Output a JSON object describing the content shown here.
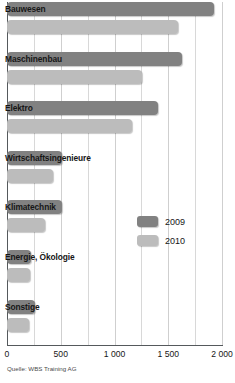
{
  "chart_data": {
    "type": "bar",
    "orientation": "horizontal",
    "title": "",
    "xlabel": "",
    "ylabel": "",
    "xlim": [
      0,
      2000
    ],
    "grid": true,
    "legend_position": "inside-right",
    "categories": [
      "Bauwesen",
      "Maschinenbau",
      "Elektro",
      "Wirtschaftsingenieure",
      "Klimatechnik",
      "Energie, Ökologie",
      "Sonstige"
    ],
    "series": [
      {
        "name": "2009",
        "color": "#818181",
        "values": [
          1930,
          1630,
          1400,
          510,
          510,
          225,
          260
        ]
      },
      {
        "name": "2010",
        "color": "#bcbcbc",
        "values": [
          1590,
          1260,
          1160,
          430,
          350,
          215,
          205
        ]
      }
    ],
    "x_ticks": [
      {
        "value": 0,
        "label": "0"
      },
      {
        "value": 500,
        "label": "500"
      },
      {
        "value": 1000,
        "label": "1 000"
      },
      {
        "value": 1500,
        "label": "1 500"
      },
      {
        "value": 2000,
        "label": "2 000"
      }
    ],
    "minor_gridline_values": [
      250,
      750,
      1250,
      1750
    ],
    "source": "Quelle: WBS Training AG"
  }
}
